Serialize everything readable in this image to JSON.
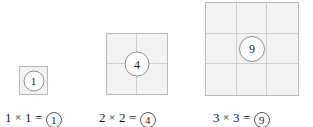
{
  "figure": {
    "colors": {
      "square_fill": "#f3f3f3",
      "square_border": "#b9b9b9",
      "grid_line": "#cfcfcf",
      "badge_fill": "#ffffff",
      "badge_border": "#8d8d8d",
      "text": "#1a1a1a",
      "background": "#ffffff"
    }
  },
  "chart_data": {
    "type": "diagram",
    "items": [
      {
        "id": "group-1",
        "side": 1,
        "rows": 1,
        "columns": 1,
        "cells": 1,
        "center_label": "1",
        "caption": {
          "left_factor": "1",
          "operator": "×",
          "right_factor": "1",
          "equals": "=",
          "result": "1",
          "full_text": "1 × 1 = ①"
        }
      },
      {
        "id": "group-2",
        "side": 2,
        "rows": 2,
        "columns": 2,
        "cells": 4,
        "center_label": "4",
        "caption": {
          "left_factor": "2",
          "operator": "×",
          "right_factor": "2",
          "equals": "=",
          "result": "4",
          "full_text": "2 × 2 = ④"
        }
      },
      {
        "id": "group-3",
        "side": 3,
        "rows": 3,
        "columns": 3,
        "cells": 9,
        "center_label": "9",
        "caption": {
          "left_factor": "3",
          "operator": "×",
          "right_factor": "3",
          "equals": "=",
          "result": "9",
          "full_text": "3 × 3 = ⑨"
        }
      }
    ]
  }
}
